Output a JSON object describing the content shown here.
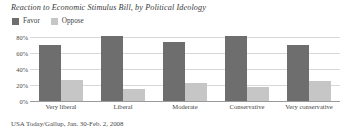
{
  "chart_data": {
    "type": "bar",
    "title": "Reaction to Economic Stimulus Bill, by Political Ideology",
    "xlabel": "",
    "ylabel": "",
    "ylim": [
      0,
      80
    ],
    "yticks": [
      "0%",
      "20%",
      "40%",
      "60%",
      "80%"
    ],
    "grid": true,
    "legend_position": "top-left",
    "categories": [
      "Very liberal",
      "Liberal",
      "Moderate",
      "Conservative",
      "Very conservative"
    ],
    "series": [
      {
        "name": "Favor",
        "color": "#6e6e6e",
        "values": [
          70,
          81,
          74,
          81,
          70
        ]
      },
      {
        "name": "Oppose",
        "color": "#c6c6c6",
        "values": [
          26,
          15,
          22,
          17,
          25
        ]
      }
    ],
    "source": "USA Today/Gallup, Jan. 30-Feb. 2, 2008"
  }
}
